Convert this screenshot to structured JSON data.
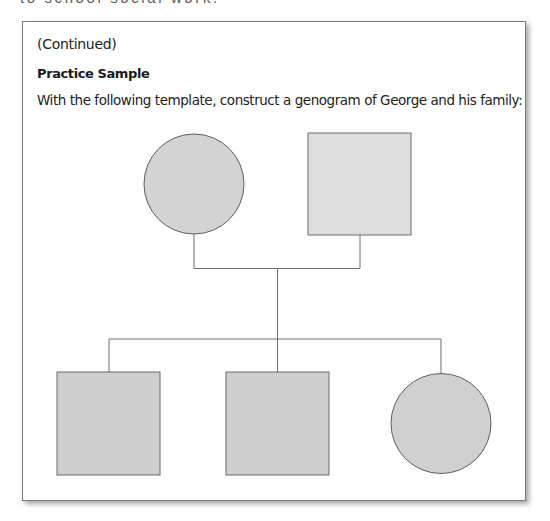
{
  "page": {
    "cut_off_header": "to school social work."
  },
  "box": {
    "continued_label": "(Continued)",
    "title": "Practice Sample",
    "instructions": "With the following template, construct a genogram of George and his family:"
  },
  "genogram": {
    "colors": {
      "line": "#6e6e6e",
      "shape_stroke": "#5e5e5e",
      "fill_default": "#d0d0d0",
      "fill_light": "#dedede",
      "card_border": "#7a7a7a"
    },
    "parents": [
      {
        "id": "mother",
        "shape": "circle",
        "role": "parent",
        "sex": "female"
      },
      {
        "id": "father",
        "shape": "square",
        "role": "parent",
        "sex": "male"
      }
    ],
    "children": [
      {
        "id": "child-1",
        "shape": "square",
        "sex": "male"
      },
      {
        "id": "child-2",
        "shape": "square",
        "sex": "male"
      },
      {
        "id": "child-3",
        "shape": "circle",
        "sex": "female"
      }
    ]
  }
}
